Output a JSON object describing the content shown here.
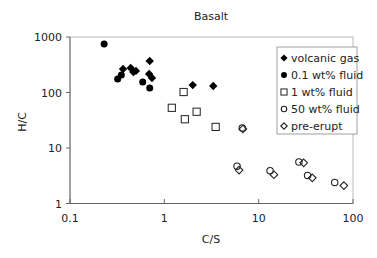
{
  "chart_data": {
    "type": "scatter",
    "title": "Basalt",
    "xlabel": "C/S",
    "ylabel": "H/C",
    "xscale": "log",
    "yscale": "log",
    "xlim": [
      0.1,
      100
    ],
    "ylim": [
      1,
      1000
    ],
    "xticks": [
      "0.1",
      "1",
      "10",
      "100"
    ],
    "yticks": [
      "1",
      "10",
      "100",
      "1000"
    ],
    "grid": false,
    "legend_position": "upper right, inside",
    "series": [
      {
        "name": "volcanic gas",
        "marker": "filled-diamond",
        "points": [
          [
            0.7,
            370
          ],
          [
            0.365,
            265
          ],
          [
            0.44,
            277
          ],
          [
            0.5,
            245
          ],
          [
            0.47,
            234
          ],
          [
            0.69,
            215
          ],
          [
            0.74,
            183
          ],
          [
            2.0,
            136
          ],
          [
            3.3,
            131
          ]
        ]
      },
      {
        "name": "0.1 wt% fluid",
        "marker": "filled-circle",
        "points": [
          [
            0.23,
            750
          ],
          [
            0.35,
            207
          ],
          [
            0.32,
            175
          ],
          [
            0.59,
            155
          ],
          [
            0.7,
            120
          ]
        ]
      },
      {
        "name": "1 wt% fluid",
        "marker": "open-square",
        "points": [
          [
            1.6,
            102
          ],
          [
            1.2,
            53
          ],
          [
            1.65,
            33
          ],
          [
            2.2,
            45
          ],
          [
            3.5,
            24
          ]
        ]
      },
      {
        "name": "50 wt% fluid",
        "marker": "open-circle",
        "points": [
          [
            6.7,
            23
          ],
          [
            5.9,
            4.7
          ],
          [
            13.2,
            3.9
          ],
          [
            26.7,
            5.6
          ],
          [
            33,
            3.2
          ],
          [
            64,
            2.4
          ]
        ]
      },
      {
        "name": "pre-erupt",
        "marker": "open-diamond",
        "points": [
          [
            6.8,
            22
          ],
          [
            6.2,
            4.0
          ],
          [
            14.5,
            3.3
          ],
          [
            30,
            5.4
          ],
          [
            37,
            2.9
          ],
          [
            80,
            2.1
          ]
        ]
      }
    ]
  }
}
